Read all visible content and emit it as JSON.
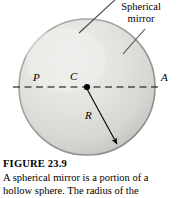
{
  "figure": {
    "caption_title": "FIGURE 23.9",
    "caption_lines": [
      "A spherical mirror is a portion of a",
      "hollow sphere. The radius of the"
    ],
    "callout": {
      "line1": "Spherical",
      "line2": "mirror"
    },
    "point_labels": {
      "P": "P",
      "C": "C",
      "A": "A",
      "R": "R"
    },
    "colors": {
      "sphere_light": "#e8e8e6",
      "sphere_mid": "#d8d8d5",
      "sphere_dark": "#bdbdba",
      "outline": "#8a8a87",
      "line": "#000000",
      "text": "#000000",
      "background": "#ffffff"
    },
    "geometry": {
      "circle_center_x": 87,
      "circle_center_y": 87,
      "circle_radius": 68,
      "axis_y": 87,
      "axis_x_start": 13,
      "axis_x_end": 160,
      "radius_arrow_to_x": 118,
      "radius_arrow_to_y": 145
    }
  }
}
